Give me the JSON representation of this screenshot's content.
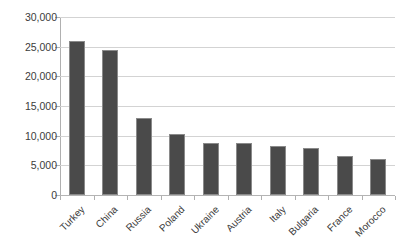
{
  "chart_data": {
    "type": "bar",
    "title": "",
    "subtitle": "",
    "xlabel": "",
    "ylabel": "",
    "categories": [
      "Turkey",
      "China",
      "Russia",
      "Poland",
      "Ukraine",
      "Austria",
      "Italy",
      "Bulgaria",
      "France",
      "Morocco"
    ],
    "values": [
      26000,
      24500,
      13000,
      10300,
      8800,
      8800,
      8200,
      8000,
      6500,
      6000
    ],
    "ylim": [
      0,
      30000
    ],
    "ytick_values": [
      0,
      5000,
      10000,
      15000,
      20000,
      25000,
      30000
    ],
    "ytick_labels": [
      "0",
      "5,000",
      "10,000",
      "15,000",
      "20,000",
      "25,000",
      "30,000"
    ],
    "grid": true,
    "grid_axis": "y",
    "legend": false,
    "legend_position": "none",
    "bar_color": "#4a4a4a",
    "bar_edge_color": "#8a8a8a",
    "gridline_color": "#d3d3d3",
    "axis_color": "#b0b0b0",
    "background_color": "#ffffff",
    "text_color": "#3b3b3b",
    "xtick_label_rotation": -45
  }
}
